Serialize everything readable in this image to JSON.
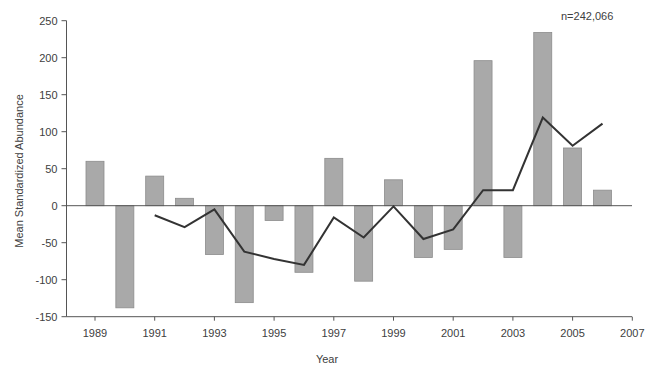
{
  "chart_data": {
    "type": "bar",
    "title": "",
    "xlabel": "Year",
    "ylabel": "Mean Standardized Abundance",
    "ylim": [
      -150,
      250
    ],
    "xlim": [
      1988,
      2007
    ],
    "yticks": [
      250,
      200,
      150,
      100,
      50,
      0,
      -50,
      -100,
      -150
    ],
    "xticks": [
      1989,
      1991,
      1993,
      1995,
      1997,
      1999,
      2001,
      2003,
      2005,
      2007
    ],
    "grid": false,
    "legend": null,
    "annotation": "n=242,066",
    "categories": [
      1989,
      1990,
      1991,
      1992,
      1993,
      1994,
      1995,
      1996,
      1997,
      1998,
      1999,
      2000,
      2001,
      2002,
      2003,
      2004,
      2005,
      2006
    ],
    "series": [
      {
        "name": "Annual mean standardized abundance",
        "type": "bar",
        "color": "#a9a9a9",
        "values": [
          60,
          -138,
          40,
          10,
          -66,
          -131,
          -20,
          -90,
          64,
          -102,
          35,
          -70,
          -59,
          196,
          -70,
          234,
          78,
          21
        ]
      },
      {
        "name": "Running mean",
        "type": "line",
        "color": "#333333",
        "x": [
          1991,
          1992,
          1993,
          1994,
          1995,
          1996,
          1997,
          1998,
          1999,
          2000,
          2001,
          2002,
          2003,
          2004,
          2005,
          2006
        ],
        "values": [
          -13,
          -29,
          -5,
          -62,
          -72,
          -80,
          -16,
          -43,
          -1,
          -45,
          -32,
          21,
          21,
          119,
          81,
          111
        ]
      }
    ]
  },
  "labels": {
    "xlabel": "Year",
    "ylabel": "Mean Standardized Abundance",
    "annotation": "n=242,066"
  }
}
